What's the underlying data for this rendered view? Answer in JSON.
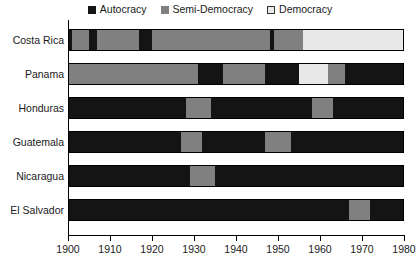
{
  "chart_data": {
    "type": "bar",
    "subtype": "stacked-timeline",
    "title": "",
    "xlabel": "",
    "ylabel": "",
    "xlim": [
      1900,
      1980
    ],
    "xticks": [
      1900,
      1910,
      1920,
      1930,
      1940,
      1950,
      1960,
      1970,
      1980
    ],
    "xtick_labels": [
      "1900",
      "1910",
      "1920",
      "1930",
      "1940",
      "1950",
      "1960",
      "1970",
      "1980"
    ],
    "grid": false,
    "legend_position": "top-center",
    "categories": [
      "Costa Rica",
      "Panama",
      "Honduras",
      "Guatemala",
      "Nicaragua",
      "El Salvador"
    ],
    "legend": [
      {
        "name": "Autocracy",
        "color": "#141414",
        "swatch": "filled"
      },
      {
        "name": "Semi-Democracy",
        "color": "#808080",
        "swatch": "filled"
      },
      {
        "name": "Democracy",
        "color": "#e8e8e8",
        "swatch": "open"
      }
    ],
    "regime_colors": {
      "Autocracy": "#141414",
      "Semi-Democracy": "#808080",
      "Democracy": "#e8e8e8"
    },
    "series": [
      {
        "name": "Costa Rica",
        "segments": [
          {
            "regime": "Autocracy",
            "start": 1900,
            "end": 1901
          },
          {
            "regime": "Semi-Democracy",
            "start": 1901,
            "end": 1905
          },
          {
            "regime": "Autocracy",
            "start": 1905,
            "end": 1907
          },
          {
            "regime": "Semi-Democracy",
            "start": 1907,
            "end": 1917
          },
          {
            "regime": "Autocracy",
            "start": 1917,
            "end": 1920
          },
          {
            "regime": "Semi-Democracy",
            "start": 1920,
            "end": 1948
          },
          {
            "regime": "Autocracy",
            "start": 1948,
            "end": 1949
          },
          {
            "regime": "Semi-Democracy",
            "start": 1949,
            "end": 1956
          },
          {
            "regime": "Democracy",
            "start": 1956,
            "end": 1980
          }
        ]
      },
      {
        "name": "Panama",
        "segments": [
          {
            "regime": "Semi-Democracy",
            "start": 1900,
            "end": 1931
          },
          {
            "regime": "Autocracy",
            "start": 1931,
            "end": 1937
          },
          {
            "regime": "Semi-Democracy",
            "start": 1937,
            "end": 1947
          },
          {
            "regime": "Autocracy",
            "start": 1947,
            "end": 1955
          },
          {
            "regime": "Democracy",
            "start": 1955,
            "end": 1962
          },
          {
            "regime": "Semi-Democracy",
            "start": 1962,
            "end": 1966
          },
          {
            "regime": "Autocracy",
            "start": 1966,
            "end": 1980
          }
        ]
      },
      {
        "name": "Honduras",
        "segments": [
          {
            "regime": "Autocracy",
            "start": 1900,
            "end": 1928
          },
          {
            "regime": "Semi-Democracy",
            "start": 1928,
            "end": 1934
          },
          {
            "regime": "Autocracy",
            "start": 1934,
            "end": 1958
          },
          {
            "regime": "Semi-Democracy",
            "start": 1958,
            "end": 1963
          },
          {
            "regime": "Autocracy",
            "start": 1963,
            "end": 1980
          }
        ]
      },
      {
        "name": "Guatemala",
        "segments": [
          {
            "regime": "Autocracy",
            "start": 1900,
            "end": 1927
          },
          {
            "regime": "Semi-Democracy",
            "start": 1927,
            "end": 1932
          },
          {
            "regime": "Autocracy",
            "start": 1932,
            "end": 1947
          },
          {
            "regime": "Semi-Democracy",
            "start": 1947,
            "end": 1953
          },
          {
            "regime": "Autocracy",
            "start": 1953,
            "end": 1980
          }
        ]
      },
      {
        "name": "Nicaragua",
        "segments": [
          {
            "regime": "Autocracy",
            "start": 1900,
            "end": 1929
          },
          {
            "regime": "Semi-Democracy",
            "start": 1929,
            "end": 1935
          },
          {
            "regime": "Autocracy",
            "start": 1935,
            "end": 1980
          }
        ]
      },
      {
        "name": "El Salvador",
        "segments": [
          {
            "regime": "Autocracy",
            "start": 1900,
            "end": 1967
          },
          {
            "regime": "Semi-Democracy",
            "start": 1967,
            "end": 1972
          },
          {
            "regime": "Autocracy",
            "start": 1972,
            "end": 1980
          }
        ]
      }
    ]
  }
}
